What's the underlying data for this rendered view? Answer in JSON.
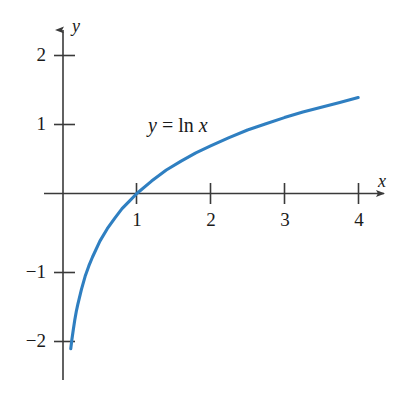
{
  "figure": {
    "kind": "cartesian-graph",
    "background_color": "#ffffff",
    "axis_color": "#3a3a3a",
    "text_color": "#1a1a1a",
    "curve_color": "#2f7fc1"
  },
  "axes": {
    "x_axis_label": "x",
    "y_axis_label": "y",
    "x_ticks": [
      {
        "value": 1,
        "label": "1"
      },
      {
        "value": 2,
        "label": "2"
      },
      {
        "value": 3,
        "label": "3"
      },
      {
        "value": 4,
        "label": "4"
      }
    ],
    "y_ticks": [
      {
        "value": 2,
        "label": "2"
      },
      {
        "value": 1,
        "label": "1"
      },
      {
        "value": -1,
        "label": "−1"
      },
      {
        "value": -2,
        "label": "−2"
      }
    ]
  },
  "annotations": {
    "curve_equation_y": "y",
    "curve_equation_eq": "=",
    "curve_equation_fn": "ln",
    "curve_equation_arg": "x"
  },
  "chart_data": {
    "type": "line",
    "title": "",
    "subtitle": "",
    "xlabel": "x",
    "ylabel": "y",
    "xlim": [
      -0.25,
      4.6
    ],
    "ylim": [
      -2.6,
      2.45
    ],
    "grid": false,
    "legend": "none",
    "annotations": [
      {
        "text": "y = ln x",
        "x": 1.25,
        "y": 0.98
      }
    ],
    "series": [
      {
        "name": "y = ln x",
        "color": "#2f7fc1",
        "x": [
          0.105,
          0.12,
          0.14,
          0.16,
          0.18,
          0.2,
          0.25,
          0.3,
          0.35,
          0.4,
          0.5,
          0.6,
          0.7,
          0.8,
          0.9,
          1.0,
          1.2,
          1.4,
          1.6,
          1.8,
          2.0,
          2.25,
          2.5,
          2.75,
          3.0,
          3.25,
          3.5,
          3.75,
          4.0
        ],
        "y": [
          -2.25,
          -2.12,
          -1.97,
          -1.83,
          -1.71,
          -1.61,
          -1.39,
          -1.2,
          -1.05,
          -0.92,
          -0.69,
          -0.51,
          -0.36,
          -0.22,
          -0.11,
          0.0,
          0.18,
          0.34,
          0.47,
          0.59,
          0.69,
          0.81,
          0.92,
          1.01,
          1.1,
          1.18,
          1.25,
          1.32,
          1.39
        ]
      }
    ]
  }
}
